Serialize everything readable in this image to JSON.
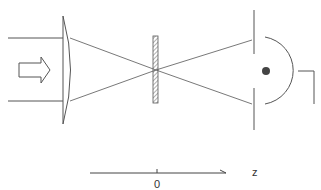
{
  "diagram": {
    "elements": {
      "incoming_beam": {
        "label": "",
        "direction": "right"
      },
      "lens": {
        "type": "plano-convex"
      },
      "sample_plate": {
        "type": "hatched slab",
        "position": "focus"
      },
      "aperture": {
        "type": "slit"
      },
      "detector": {
        "type": "hemispherical detector with point"
      }
    },
    "axis": {
      "label": "z",
      "origin_label": "0"
    },
    "colors": {
      "stroke": "#555555",
      "dot": "#444444"
    }
  }
}
